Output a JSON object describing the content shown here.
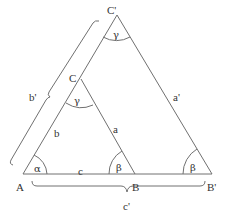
{
  "diagram": {
    "vertices": {
      "A": "A",
      "B": "B",
      "C": "C",
      "B_prime": "B'",
      "C_prime": "C'"
    },
    "sides": {
      "a": "a",
      "b": "b",
      "c": "c",
      "a_prime": "a'",
      "b_prime": "b'",
      "c_prime": "c'"
    },
    "angles": {
      "alpha": "α",
      "beta_small": "β",
      "beta_large": "β",
      "gamma_small": "γ",
      "gamma_large": "γ"
    },
    "colors": {
      "line": "#707070",
      "text": "#333333",
      "background": "#ffffff"
    }
  }
}
